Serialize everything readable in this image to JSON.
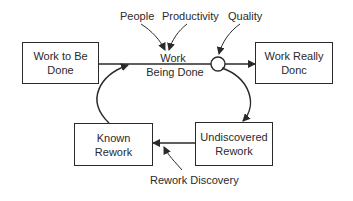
{
  "diagram": {
    "stocks": {
      "work_to_be_done": "Work to Be Done",
      "work_really_done": "Work Really Donc",
      "known_rework": "Known Rework",
      "undiscovered_rework": "Undiscovered Rework"
    },
    "flows": {
      "work_being_done_line1": "Work",
      "work_being_done_line2": "Being Done",
      "rework_discovery": "Rework Discovery"
    },
    "influences": {
      "people": "People",
      "productivity": "Productivity",
      "quality": "Quality"
    },
    "stroke_color": "#2a2a2a"
  }
}
